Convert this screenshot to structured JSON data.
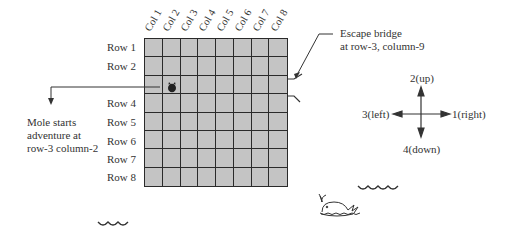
{
  "grid": {
    "rows": 8,
    "cols": 8,
    "column_labels": [
      "Col 1",
      "Col 2",
      "Col 3",
      "Col 4",
      "Col 5",
      "Col 6",
      "Col 7",
      "Col 8"
    ],
    "row_labels": [
      "Row 1",
      "Row 2",
      "",
      "Row 4",
      "Row 5",
      "Row 6",
      "Row 7",
      "Row 8"
    ],
    "cell_color": "#c4c4c4",
    "line_color": "#2a2a2a"
  },
  "mole": {
    "row": 3,
    "col": 2,
    "icon": "mole-icon"
  },
  "annotations": {
    "start": {
      "line1": "Mole starts",
      "line2": "adventure at",
      "line3": "row-3 column-2"
    },
    "bridge": {
      "line1": "Escape bridge",
      "line2": "at row-3, column-9"
    }
  },
  "compass": {
    "up": "2(up)",
    "down": "4(down)",
    "left": "3(left)",
    "right": "1(right)"
  },
  "decorations": [
    "wave-icon",
    "wave-icon",
    "whale-icon"
  ]
}
